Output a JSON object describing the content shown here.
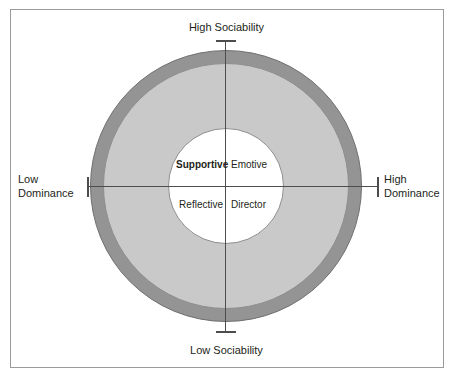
{
  "diagram": {
    "axes": {
      "vertical": {
        "top_label": "High Sociability",
        "bottom_label": "Low Sociability"
      },
      "horizontal": {
        "left_label": "Low\nDominance",
        "right_label": "High\nDominance"
      }
    },
    "quadrants": [
      {
        "id": "supportive",
        "label": "Supportive",
        "position": "top-left",
        "emphasis": "bold"
      },
      {
        "id": "emotive",
        "label": "Emotive",
        "position": "top-right",
        "emphasis": "normal"
      },
      {
        "id": "reflective",
        "label": "Reflective",
        "position": "bottom-left",
        "emphasis": "normal"
      },
      {
        "id": "director",
        "label": "Director",
        "position": "bottom-right",
        "emphasis": "normal"
      }
    ],
    "rings": [
      {
        "id": "outer-ring",
        "fill": "#949494",
        "stroke": "#6f6f6f"
      },
      {
        "id": "middle-ring",
        "fill": "#c9c9c9",
        "stroke": "#8e8e8e"
      },
      {
        "id": "inner-core",
        "fill": "#ffffff",
        "stroke": "#8e8e8e"
      }
    ],
    "colors": {
      "outer_ring": "#949494",
      "middle_ring": "#c9c9c9",
      "inner_core": "#ffffff",
      "axis_line": "#4d4d4d",
      "frame_border": "#9b9b9b",
      "text": "#231f20"
    }
  }
}
